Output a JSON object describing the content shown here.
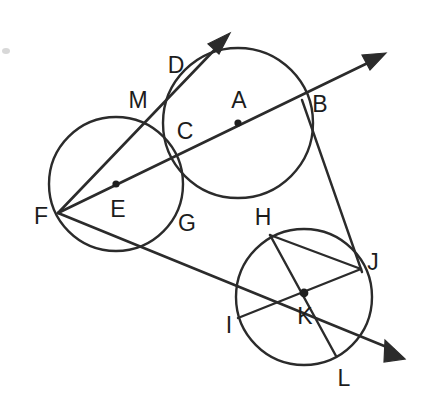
{
  "figure": {
    "kind": "geometry-diagram",
    "canvas": {
      "width": 425,
      "height": 404,
      "background": "#ffffff"
    },
    "stroke_color": "#2b2b2b",
    "label_color": "#1c1c1c",
    "label_font_size": 23,
    "circles": [
      {
        "name": "circle-a",
        "center_label": "A",
        "cx": 238,
        "cy": 123,
        "r": 75
      },
      {
        "name": "circle-e",
        "center_label": "E",
        "cx": 116,
        "cy": 184,
        "r": 67
      },
      {
        "name": "circle-k",
        "center_label": "K",
        "cx": 304,
        "cy": 297,
        "r": 68
      }
    ],
    "center_dots": [
      {
        "name": "center-dot-a",
        "x": 238,
        "y": 123,
        "r": 3.6
      },
      {
        "name": "center-dot-e",
        "x": 116,
        "y": 184,
        "r": 3.6
      },
      {
        "name": "center-dot-k",
        "x": 304,
        "y": 293,
        "r": 4.2
      }
    ],
    "points": [
      {
        "label": "D",
        "label_x": 176,
        "label_y": 65,
        "kind": "ray-label"
      },
      {
        "label": "A",
        "label_x": 239,
        "label_y": 100,
        "kind": "circle-center"
      },
      {
        "label": "B",
        "label_x": 320,
        "label_y": 104,
        "kind": "intersection"
      },
      {
        "label": "M",
        "label_x": 138,
        "label_y": 100,
        "kind": "intersection"
      },
      {
        "label": "C",
        "label_x": 185,
        "label_y": 131,
        "kind": "intersection"
      },
      {
        "label": "F",
        "label_x": 41,
        "label_y": 216,
        "kind": "vertex"
      },
      {
        "label": "E",
        "label_x": 118,
        "label_y": 209,
        "kind": "circle-center"
      },
      {
        "label": "G",
        "label_x": 187,
        "label_y": 223,
        "kind": "intersection"
      },
      {
        "label": "H",
        "label_x": 263,
        "label_y": 217,
        "kind": "intersection"
      },
      {
        "label": "J",
        "label_x": 373,
        "label_y": 262,
        "kind": "vertex"
      },
      {
        "label": "I",
        "label_x": 229,
        "label_y": 325,
        "kind": "on-circle"
      },
      {
        "label": "K",
        "label_x": 305,
        "label_y": 316,
        "kind": "circle-center"
      },
      {
        "label": "L",
        "label_x": 344,
        "label_y": 378,
        "kind": "on-circle"
      }
    ],
    "rays": [
      {
        "name": "ray-f-d",
        "description": "Ray from F through M and D, arrowhead upper-left area",
        "from": {
          "x": 58,
          "y": 213
        },
        "to": {
          "x": 228,
          "y": 36
        },
        "arrow_at": "to"
      },
      {
        "name": "ray-f-b",
        "description": "Ray from F through C, A, B, arrowhead upper-right",
        "from": {
          "x": 58,
          "y": 213
        },
        "to": {
          "x": 383,
          "y": 55
        },
        "arrow_at": "to"
      },
      {
        "name": "ray-f-j-l-arrow",
        "description": "Ray from F through G, H, J continuing to lower-right arrowhead",
        "from": {
          "x": 58,
          "y": 213
        },
        "to": {
          "x": 403,
          "y": 358
        },
        "arrow_at": "to"
      }
    ],
    "segments": [
      {
        "name": "segment-b-j",
        "x1": 302,
        "y1": 100,
        "x2": 361,
        "y2": 269
      },
      {
        "name": "segment-h-l",
        "x1": 270,
        "y1": 235,
        "x2": 336,
        "y2": 356
      },
      {
        "name": "segment-i-j",
        "x1": 238,
        "y1": 318,
        "x2": 361,
        "y2": 269
      },
      {
        "name": "segment-h-j",
        "x1": 270,
        "y1": 235,
        "x2": 361,
        "y2": 269
      }
    ],
    "intersections": [
      {
        "name": "intersection-m",
        "x": 148,
        "y": 122
      },
      {
        "name": "intersection-c",
        "x": 177,
        "y": 152
      },
      {
        "name": "intersection-g",
        "x": 178,
        "y": 205
      },
      {
        "name": "intersection-h",
        "x": 270,
        "y": 235
      },
      {
        "name": "intersection-b",
        "x": 302,
        "y": 100
      },
      {
        "name": "vertex-f",
        "x": 58,
        "y": 213
      },
      {
        "name": "vertex-j",
        "x": 361,
        "y": 269
      },
      {
        "name": "point-i",
        "x": 238,
        "y": 318
      },
      {
        "name": "point-l",
        "x": 336,
        "y": 356
      }
    ],
    "artifacts": [
      {
        "name": "scan-speck-left",
        "x": 2,
        "y": 48,
        "w": 8,
        "h": 6
      }
    ]
  }
}
